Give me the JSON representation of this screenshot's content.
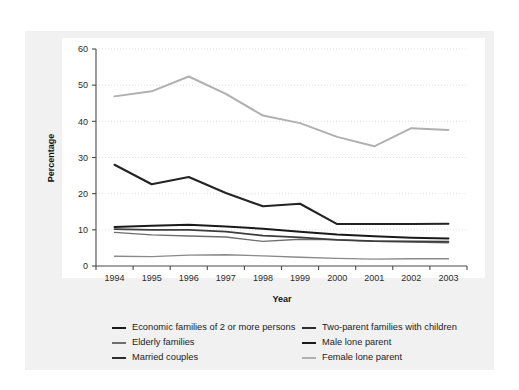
{
  "chart_data": {
    "type": "line",
    "title": "",
    "xlabel": "Year",
    "ylabel": "Percentage",
    "categories": [
      "1994",
      "1995",
      "1996",
      "1997",
      "1998",
      "1999",
      "2000",
      "2001",
      "2002",
      "2003"
    ],
    "x": [
      1994,
      1995,
      1996,
      1997,
      1998,
      1999,
      2000,
      2001,
      2002,
      2003
    ],
    "ylim": [
      0,
      60
    ],
    "yticks": [
      0,
      10,
      20,
      30,
      40,
      50,
      60
    ],
    "grid": true,
    "legend_position": "bottom",
    "series": [
      {
        "name": "Economic families of 2 or more persons",
        "color": "#1a1a1a",
        "width": 2.0,
        "values": [
          10.8,
          11.1,
          11.4,
          10.9,
          10.3,
          9.5,
          8.7,
          8.2,
          7.8,
          7.6
        ]
      },
      {
        "name": "Elderly families",
        "color": "#6e6e6e",
        "width": 1.4,
        "values": [
          9.3,
          8.6,
          8.3,
          8.0,
          6.8,
          7.4,
          7.3,
          6.8,
          6.6,
          6.4
        ]
      },
      {
        "name": "Married couples",
        "color": "#8a8a8a",
        "width": 1.4,
        "values": [
          2.7,
          2.6,
          3.0,
          3.1,
          2.8,
          2.4,
          2.1,
          1.9,
          2.0,
          2.0
        ]
      },
      {
        "name": "Two-parent families with children",
        "color": "#232323",
        "width": 2.1,
        "values": [
          28.0,
          22.6,
          24.6,
          20.2,
          16.5,
          17.2,
          11.6,
          11.6,
          11.6,
          11.7
        ]
      },
      {
        "name": "Male lone parent",
        "color": "#3d3d3d",
        "width": 1.8,
        "values": [
          10.2,
          10.0,
          10.0,
          9.5,
          8.4,
          7.9,
          7.2,
          6.9,
          6.8,
          6.7
        ]
      },
      {
        "name": "Female lone parent",
        "color": "#b0b0b0",
        "width": 2.0,
        "values": [
          46.9,
          48.3,
          52.4,
          47.6,
          41.6,
          39.5,
          35.7,
          33.1,
          38.1,
          37.6
        ]
      }
    ]
  },
  "legend": {
    "left_column": [
      {
        "label": "Economic families of 2 or more persons",
        "color": "#1a1a1a",
        "width": 2.6
      },
      {
        "label": "Elderly families",
        "color": "#6e6e6e",
        "width": 2.0
      },
      {
        "label": "Married couples",
        "color": "#2e2e2e",
        "width": 2.6
      }
    ],
    "right_column": [
      {
        "label": "Two-parent families with children",
        "color": "#2e2e2e",
        "width": 2.4
      },
      {
        "label": "Male lone parent",
        "color": "#1a1a1a",
        "width": 2.6
      },
      {
        "label": "Female lone parent",
        "color": "#b0b0b0",
        "width": 2.2
      }
    ]
  },
  "axes": {
    "y_title": "Percentage",
    "x_title": "Year",
    "y_tick_labels": [
      "0",
      "10",
      "20",
      "30",
      "40",
      "50",
      "60"
    ],
    "x_tick_labels": [
      "1994",
      "1995",
      "1996",
      "1997",
      "1998",
      "1999",
      "2000",
      "2001",
      "2002",
      "2003"
    ]
  },
  "colors": {
    "panel_background": "#f1f1f1",
    "plot_background": "#ffffff",
    "axis_line": "#4a4a4a",
    "gridline": "#d8d8d8",
    "text": "#1c1c1c"
  }
}
